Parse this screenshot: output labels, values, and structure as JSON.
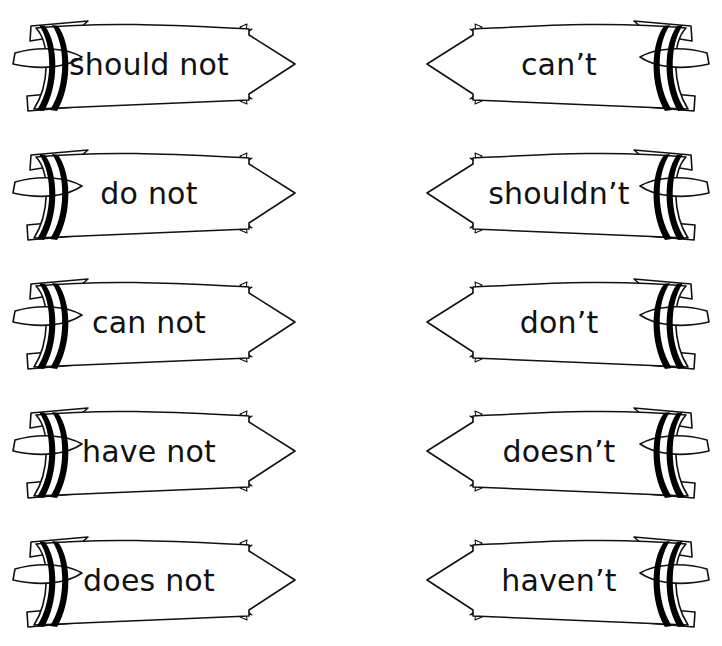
{
  "page": {
    "title_clipped": "",
    "background_color": "#ffffff",
    "ink_color": "#111111",
    "stripe_color": "#000000",
    "fill_color": "#ffffff"
  },
  "worksheet": {
    "columns": [
      {
        "name": "full-forms",
        "direction": "right",
        "items": [
          {
            "label": "should not"
          },
          {
            "label": "do not"
          },
          {
            "label": "can not"
          },
          {
            "label": "have not"
          },
          {
            "label": "does not"
          }
        ]
      },
      {
        "name": "contractions",
        "direction": "left",
        "items": [
          {
            "label": "can’t"
          },
          {
            "label": "shouldn’t"
          },
          {
            "label": "don’t"
          },
          {
            "label": "doesn’t"
          },
          {
            "label": "haven’t"
          }
        ]
      }
    ],
    "rows": [
      {
        "left": "should not",
        "right": "can’t"
      },
      {
        "left": "do not",
        "right": "shouldn’t"
      },
      {
        "left": "can not",
        "right": "don’t"
      },
      {
        "left": "have not",
        "right": "doesn’t"
      },
      {
        "left": "does not",
        "right": "haven’t"
      }
    ],
    "row_count": 5,
    "arrow_count": 10
  }
}
